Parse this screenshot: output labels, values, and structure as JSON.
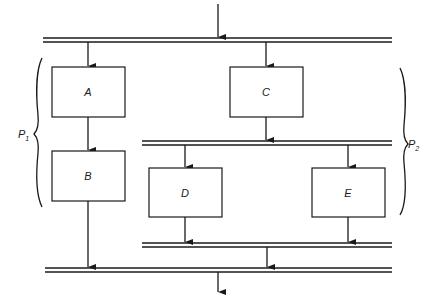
{
  "diagram": {
    "type": "parallel-process-flow",
    "processes": [
      {
        "id": "A",
        "label": "A",
        "group": "P1"
      },
      {
        "id": "B",
        "label": "B",
        "group": "P1"
      },
      {
        "id": "C",
        "label": "C",
        "group": "P2"
      },
      {
        "id": "D",
        "label": "D",
        "group": "P2"
      },
      {
        "id": "E",
        "label": "E",
        "group": "P2"
      }
    ],
    "groups": [
      {
        "id": "P1",
        "label": "P",
        "subscript": "1",
        "members": [
          "A",
          "B"
        ]
      },
      {
        "id": "P2",
        "label": "P",
        "subscript": "2",
        "members": [
          "C",
          "D",
          "E"
        ]
      }
    ],
    "buses": [
      {
        "id": "fork-main",
        "kind": "fork"
      },
      {
        "id": "fork-p2",
        "kind": "fork"
      },
      {
        "id": "join-p2",
        "kind": "join"
      },
      {
        "id": "join-main",
        "kind": "join"
      }
    ],
    "edges": [
      {
        "from": "input",
        "to": "fork-main"
      },
      {
        "from": "fork-main",
        "to": "A"
      },
      {
        "from": "fork-main",
        "to": "C"
      },
      {
        "from": "A",
        "to": "B"
      },
      {
        "from": "B",
        "to": "join-main"
      },
      {
        "from": "C",
        "to": "fork-p2"
      },
      {
        "from": "fork-p2",
        "to": "D"
      },
      {
        "from": "fork-p2",
        "to": "E"
      },
      {
        "from": "D",
        "to": "join-p2"
      },
      {
        "from": "E",
        "to": "join-p2"
      },
      {
        "from": "join-p2",
        "to": "join-main"
      },
      {
        "from": "join-main",
        "to": "output"
      }
    ]
  }
}
